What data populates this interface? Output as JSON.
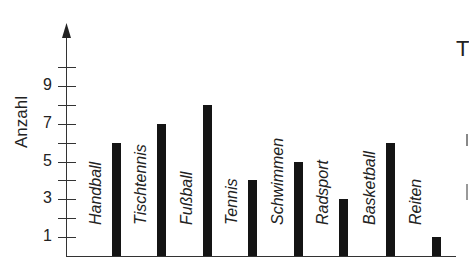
{
  "chart_data": {
    "type": "bar",
    "title": "",
    "xlabel": "",
    "ylabel": "Anzahl",
    "categories": [
      "Handball",
      "Tischtennis",
      "Fußball",
      "Tennis",
      "Schwimmen",
      "Radsport",
      "Basketball",
      "Reiten"
    ],
    "values": [
      6,
      7,
      8,
      4,
      5,
      3,
      6,
      1
    ],
    "ylim": [
      0,
      10
    ],
    "y_ticks": [
      1,
      2,
      3,
      4,
      5,
      6,
      7,
      8,
      9,
      10
    ],
    "y_tick_labels": [
      "1",
      "3",
      "5",
      "7",
      "9"
    ],
    "grid": false,
    "legend": null,
    "bar_color": "#141414",
    "category_label_style": "italic, rotated vertical, placed left of each bar",
    "y_axis_arrow": true
  },
  "cut_off_text": {
    "right_edge_char": "T"
  }
}
